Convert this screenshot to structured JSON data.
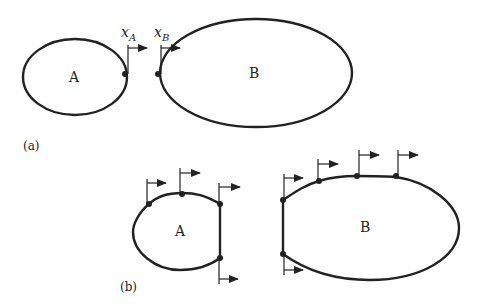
{
  "figure": {
    "panel_a": {
      "label": "(a)",
      "body_a_label": "A",
      "body_b_label": "B",
      "coord_a": {
        "base": "x",
        "sub": "A"
      },
      "coord_b": {
        "base": "x",
        "sub": "B"
      }
    },
    "panel_b": {
      "label": "(b)",
      "body_a_label": "A",
      "body_b_label": "B",
      "body_a_contact_points": 4,
      "body_b_contact_points": 5
    },
    "colors": {
      "ink": "#222222",
      "background": "#ffffff"
    }
  }
}
